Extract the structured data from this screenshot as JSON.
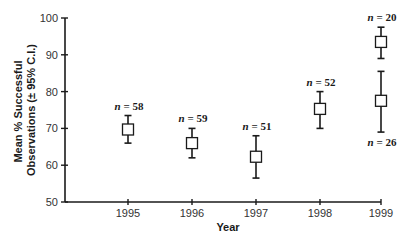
{
  "chart_data": {
    "type": "scatter",
    "subtype": "mean_with_error_bars",
    "title": "",
    "xlabel": "Year",
    "ylabel_lines": [
      "Mean % Successful",
      "Observations (± 95% C.I.)"
    ],
    "ylabel": "Mean % Successful Observations (± 95% C.I.)",
    "ylim": [
      50,
      100
    ],
    "yticks": [
      50,
      60,
      70,
      80,
      90,
      100
    ],
    "categories": [
      "1995",
      "1996",
      "1997",
      "1998",
      "1999"
    ],
    "grid": false,
    "legend": null,
    "points": [
      {
        "x": "1995",
        "mean": 69.7,
        "ci_low": 66.0,
        "ci_high": 73.5,
        "n": 58,
        "n_label": "n = 58",
        "label_pos": "above"
      },
      {
        "x": "1996",
        "mean": 66.0,
        "ci_low": 62.0,
        "ci_high": 70.0,
        "n": 59,
        "n_label": "n = 59",
        "label_pos": "above"
      },
      {
        "x": "1997",
        "mean": 62.3,
        "ci_low": 56.5,
        "ci_high": 68.0,
        "n": 51,
        "n_label": "n = 51",
        "label_pos": "above"
      },
      {
        "x": "1998",
        "mean": 75.3,
        "ci_low": 70.0,
        "ci_high": 80.0,
        "n": 52,
        "n_label": "n = 52",
        "label_pos": "above"
      },
      {
        "x": "1999",
        "mean": 93.5,
        "ci_low": 89.0,
        "ci_high": 97.5,
        "n": 20,
        "n_label": "n = 20",
        "label_pos": "above"
      },
      {
        "x": "1999",
        "mean": 77.5,
        "ci_low": 69.0,
        "ci_high": 85.5,
        "n": 26,
        "n_label": "n = 26",
        "label_pos": "below"
      }
    ]
  },
  "layout_px": {
    "x_axis_y": 202,
    "y_axis_x": 65,
    "x_axis_end": 381,
    "y_top_px": 18,
    "x_positions": {
      "1995": 128,
      "1996": 192,
      "1997": 256,
      "1998": 320,
      "1999": 381
    }
  }
}
